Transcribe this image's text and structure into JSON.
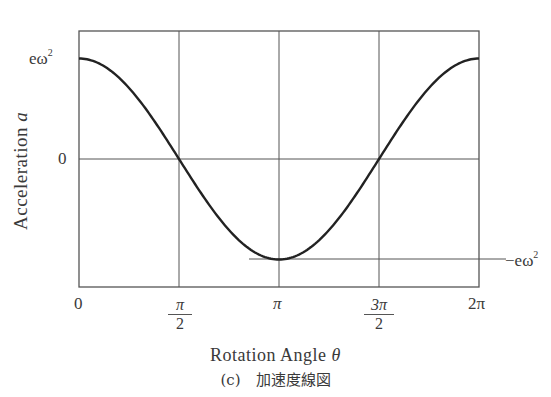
{
  "chart_data": {
    "type": "line",
    "title": "",
    "xlabel": "Rotation Angle θ",
    "ylabel": "Acceleration a",
    "caption": "(c)　加速度線図",
    "x_ticks": [
      "0",
      "π/2",
      "π",
      "3π/2",
      "2π"
    ],
    "x_tick_values": [
      0,
      1.5708,
      3.1416,
      4.7124,
      6.2832
    ],
    "y_ticks": [
      "eω²",
      "0",
      "−eω²"
    ],
    "y_tick_values": [
      1,
      0,
      -1
    ],
    "xlim": [
      0,
      6.2832
    ],
    "ylim": [
      -1.28,
      1.28
    ],
    "grid": "vertical lines at π/2, π, 3π/2; horizontal line at 0",
    "series": [
      {
        "name": "a = eω² cos θ",
        "x": [
          0,
          0.785,
          1.5708,
          2.356,
          3.1416,
          3.927,
          4.7124,
          5.498,
          6.2832
        ],
        "values": [
          1,
          0.707,
          0,
          -0.707,
          -1,
          -0.707,
          0,
          0.707,
          1
        ]
      }
    ],
    "annotations": [
      {
        "text": "−eω²",
        "position": "right of plot at minimum, with horizontal reference line from θ≈3π/4 to right edge"
      }
    ]
  },
  "labels": {
    "y_max_base": "eω",
    "y_max_sup": "2",
    "y_zero": "0",
    "y_min_base": "−eω",
    "y_min_sup": "2",
    "x0": "0",
    "x1_num": "π",
    "x1_den": "2",
    "x2": "π",
    "x3_num": "3π",
    "x3_den": "2",
    "x4": "2π",
    "ylabel_text": "Acceleration ",
    "ylabel_var": "a",
    "xlabel_text": "Rotation Angle ",
    "xlabel_var": "θ",
    "caption": "(c)　加速度線図"
  }
}
